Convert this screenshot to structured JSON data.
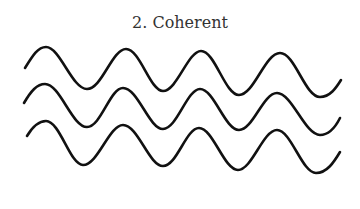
{
  "title": "2. Coherent",
  "diagram": {
    "type": "waves",
    "wave_count": 3,
    "stroke_color": "#111111",
    "waves": [
      {
        "name": "wave-1",
        "d": "M25,68 C33,55 38,47 46,47 C60,47 72,89 87,89 C102,89 112,49 126,49 C140,49 150,91 163,91 C177,91 188,51 201,51 C215,51 225,95 239,95 C254,95 265,53 280,53 C295,53 305,97 320,97 C330,97 336,88 341,80"
      },
      {
        "name": "wave-2",
        "d": "M24,103 C31,91 37,84 45,84 C60,84 72,127 87,127 C101,127 110,88 123,88 C138,88 149,129 163,129 C177,129 187,89 200,89 C214,89 225,130 239,130 C253,130 263,93 277,93 C292,93 305,135 320,135 C330,135 336,126 340,118"
      },
      {
        "name": "wave-3",
        "d": "M27,136 C33,126 39,121 46,121 C60,121 70,165 83,165 C98,165 109,125 123,125 C138,125 149,166 163,166 C177,166 186,128 199,128 C213,128 224,170 238,170 C252,170 263,130 277,130 C291,130 302,173 316,173 C327,173 334,162 340,152"
      }
    ]
  }
}
